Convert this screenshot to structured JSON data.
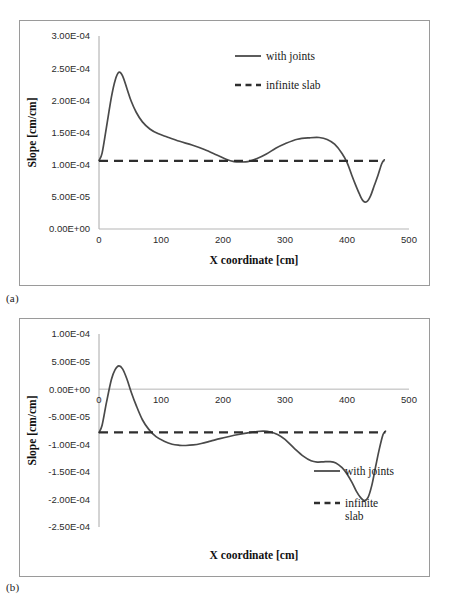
{
  "figure": {
    "captions": [
      {
        "id": "a",
        "text": "(a)"
      },
      {
        "id": "b",
        "text": "(b)"
      }
    ]
  },
  "chart_data": [
    {
      "id": "chart-a",
      "type": "line",
      "title": "",
      "xlabel": "X coordinate  [cm]",
      "ylabel": "Slope [cm/cm]",
      "xlim": [
        0,
        500
      ],
      "ylim": [
        0,
        0.0003
      ],
      "grid": false,
      "legend_position": "top-right",
      "xticks": [
        "0",
        "100",
        "200",
        "300",
        "400",
        "500"
      ],
      "xtick_values": [
        0,
        100,
        200,
        300,
        400,
        500
      ],
      "yticks": [
        "0.00E+00",
        "5.00E-05",
        "1.00E-04",
        "1.50E-04",
        "2.00E-04",
        "2.50E-04",
        "3.00E-04"
      ],
      "ytick_values": [
        0,
        5e-05,
        0.0001,
        0.00015,
        0.0002,
        0.00025,
        0.0003
      ],
      "series": [
        {
          "name": "with joints",
          "style": "solid",
          "color": "#4a4a4a",
          "x": [
            0,
            5,
            12,
            20,
            26,
            32,
            38,
            45,
            52,
            60,
            70,
            82,
            95,
            110,
            130,
            150,
            170,
            190,
            205,
            218,
            228,
            240,
            255,
            270,
            285,
            300,
            320,
            340,
            355,
            368,
            380,
            392,
            400,
            407,
            413,
            420,
            426,
            432,
            438,
            444,
            450,
            456,
            460
          ],
          "y": [
            0.0001065,
            0.000118,
            0.000158,
            0.000205,
            0.000231,
            0.0002435,
            0.000238,
            0.0002185,
            0.0001985,
            0.0001815,
            0.0001665,
            0.0001555,
            0.0001483,
            0.000143,
            0.0001363,
            0.0001305,
            0.0001235,
            0.000115,
            0.0001085,
            0.0001048,
            0.0001042,
            0.0001048,
            0.0001095,
            0.0001165,
            0.0001255,
            0.0001325,
            0.0001395,
            0.0001418,
            0.0001422,
            0.0001392,
            0.0001318,
            0.0001175,
            0.0001035,
            8.55e-05,
            7.05e-05,
            5.45e-05,
            4.38e-05,
            4.25e-05,
            5.15e-05,
            6.75e-05,
            8.35e-05,
            0.0001015,
            0.0001075
          ]
        },
        {
          "name": "infinite slab",
          "style": "dashed",
          "color": "#2e2e2e",
          "x": [
            0,
            460
          ],
          "y": [
            0.0001058,
            0.0001058
          ]
        }
      ],
      "legend": [
        {
          "label": "with joints",
          "style": "solid"
        },
        {
          "label": "infinite slab",
          "style": "dashed"
        }
      ]
    },
    {
      "id": "chart-b",
      "type": "line",
      "title": "",
      "xlabel": "X coordinate  [cm]",
      "ylabel": "Slope [cm/cm]",
      "xlim": [
        0,
        500
      ],
      "ylim": [
        -0.00025,
        0.0001
      ],
      "grid": false,
      "legend_position": "right",
      "xticks": [
        "0",
        "100",
        "200",
        "300",
        "400",
        "500"
      ],
      "xtick_values": [
        0,
        100,
        200,
        300,
        400,
        500
      ],
      "yticks": [
        "1.00E-04",
        "5.00E-05",
        "0.00E+00",
        "-5.00E-05",
        "-1.00E-04",
        "-1.50E-04",
        "-2.00E-04",
        "-2.50E-04"
      ],
      "ytick_values": [
        0.0001,
        5e-05,
        0,
        -5e-05,
        -0.0001,
        -0.00015,
        -0.0002,
        -0.00025
      ],
      "series": [
        {
          "name": "with joints",
          "style": "solid",
          "color": "#4a4a4a",
          "x": [
            0,
            5,
            12,
            20,
            26,
            32,
            38,
            45,
            52,
            60,
            70,
            80,
            92,
            105,
            118,
            130,
            140,
            152,
            165,
            180,
            195,
            210,
            225,
            240,
            255,
            265,
            275,
            288,
            300,
            315,
            330,
            342,
            352,
            362,
            372,
            382,
            392,
            400,
            408,
            415,
            422,
            428,
            434,
            440,
            446,
            452,
            458,
            462
          ],
          "y": [
            -7.85e-05,
            -6.55e-05,
            -2.45e-05,
            1.75e-05,
            3.55e-05,
            4.22e-05,
            3.68e-05,
            1.85e-05,
            -5.5e-06,
            -2.95e-05,
            -5.55e-05,
            -7.25e-05,
            -8.62e-05,
            -9.45e-05,
            -0.0001,
            -0.0001018,
            -0.0001022,
            -0.0001012,
            -9.85e-05,
            -9.42e-05,
            -8.98e-05,
            -8.58e-05,
            -8.22e-05,
            -7.92e-05,
            -7.68e-05,
            -7.62e-05,
            -7.72e-05,
            -8.22e-05,
            -9.12e-05,
            -0.0001072,
            -0.0001218,
            -0.0001298,
            -0.0001322,
            -0.0001318,
            -0.0001315,
            -0.0001338,
            -0.0001425,
            -0.0001538,
            -0.000169,
            -0.0001848,
            -0.0001968,
            -0.0002022,
            -0.0001962,
            -0.0001745,
            -0.0001415,
            -0.0001092,
            -8.28e-05,
            -7.62e-05
          ]
        },
        {
          "name": "infinite slab",
          "style": "dashed",
          "color": "#2e2e2e",
          "x": [
            0,
            462
          ],
          "y": [
            -7.85e-05,
            -7.85e-05
          ]
        }
      ],
      "legend": [
        {
          "label": "with joints",
          "style": "solid"
        },
        {
          "label": "infinite slab",
          "style": "dashed",
          "wrapped": [
            "infinite",
            "slab"
          ]
        }
      ]
    }
  ]
}
